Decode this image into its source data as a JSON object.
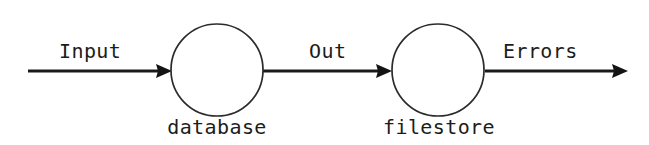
{
  "diagram": {
    "type": "flow-diagram",
    "title": "",
    "background_color": "#ffffff",
    "stroke_color": "#1a1a1a",
    "text_color": "#1c1c1c",
    "nodes": [
      {
        "id": "database",
        "label": "database",
        "shape": "circle",
        "cx": 217,
        "cy": 70,
        "r": 46
      },
      {
        "id": "filestore",
        "label": "filestore",
        "shape": "circle",
        "cx": 438,
        "cy": 70,
        "r": 46
      }
    ],
    "edges": [
      {
        "id": "input-edge",
        "label": "Input",
        "from": "",
        "to": "database",
        "x1": 28,
        "x2": 172,
        "y": 71,
        "arrowhead": "end"
      },
      {
        "id": "out-edge",
        "label": "Out",
        "from": "database",
        "to": "filestore",
        "x1": 263,
        "x2": 392,
        "y": 71,
        "arrowhead": "end"
      },
      {
        "id": "errors-edge",
        "label": "Errors",
        "from": "filestore",
        "to": "",
        "x1": 485,
        "x2": 628,
        "y": 71,
        "arrowhead": "end"
      }
    ]
  }
}
